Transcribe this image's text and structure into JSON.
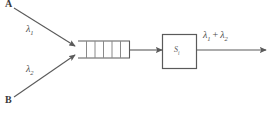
{
  "figure": {
    "type": "queueing-network-diagram",
    "background_color": "#ffffff",
    "line_color": "#5a5a5a",
    "text_color": "#3a3a3a"
  },
  "sources": [
    {
      "id": "a",
      "label": "A",
      "rate_label": "λ",
      "rate_subscript": "1"
    },
    {
      "id": "b",
      "label": "B",
      "rate_label": "λ",
      "rate_subscript": "2"
    }
  ],
  "queue": {
    "name": "fifo-buffer",
    "cell_count": 6,
    "divider_count": 5,
    "open_side": "left"
  },
  "server": {
    "name": "server-box",
    "label": "S",
    "label_subscript": "i"
  },
  "output": {
    "label": "λ",
    "subscript_1": "1",
    "plus": "+",
    "label_2": "λ",
    "subscript_2": "2"
  }
}
